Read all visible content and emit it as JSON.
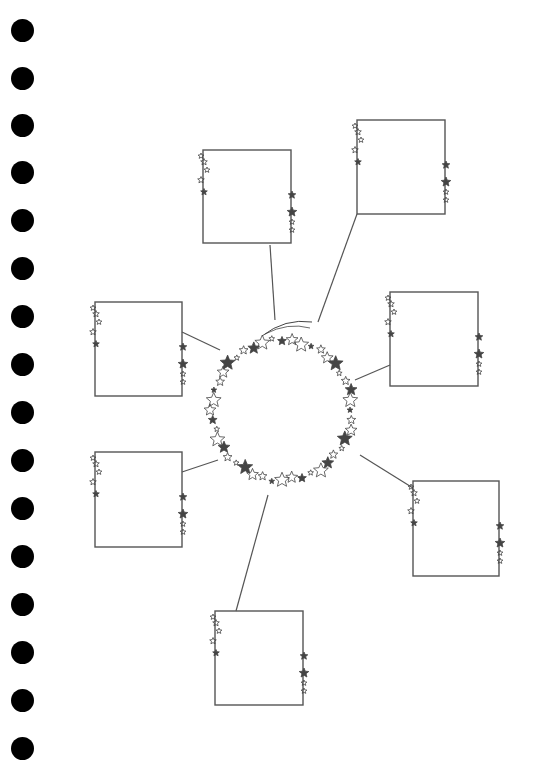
{
  "worksheet": {
    "type": "star-themed mind map",
    "center": {
      "cx": 282,
      "cy": 410,
      "r": 70
    },
    "punch_holes_y": [
      30,
      78,
      125,
      172,
      220,
      268,
      316,
      364,
      412,
      460,
      508,
      556,
      604,
      652,
      700,
      748
    ],
    "boxes": [
      {
        "id": "top-left",
        "x": 203,
        "y": 150,
        "w": 88,
        "h": 93
      },
      {
        "id": "top-right",
        "x": 357,
        "y": 120,
        "w": 88,
        "h": 94
      },
      {
        "id": "mid-left",
        "x": 95,
        "y": 302,
        "w": 87,
        "h": 94
      },
      {
        "id": "mid-right",
        "x": 390,
        "y": 292,
        "w": 88,
        "h": 94
      },
      {
        "id": "low-left",
        "x": 95,
        "y": 452,
        "w": 87,
        "h": 95
      },
      {
        "id": "low-right",
        "x": 413,
        "y": 481,
        "w": 86,
        "h": 95
      },
      {
        "id": "bottom",
        "x": 215,
        "y": 611,
        "w": 88,
        "h": 94
      }
    ],
    "colors": {
      "line": "#555555",
      "star": "#444444",
      "hole": "#000000"
    }
  }
}
